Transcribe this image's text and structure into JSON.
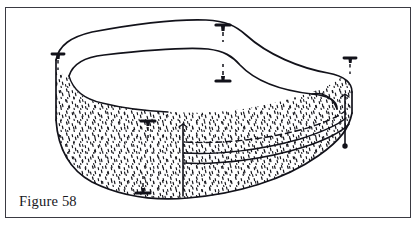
{
  "figure": {
    "caption": "Figure 58",
    "frame": {
      "border_color": "#3a3a42",
      "background_color": "#ffffff",
      "x": 5,
      "y": 7,
      "width": 406,
      "height": 211
    },
    "ink_color": "#12121a",
    "fabric_fill_color": "#ffffff",
    "stipple_color": "#16161c",
    "line_work": {
      "top_rim_outer": "M 56,59 C 60,44 72,36 92,32 C 140,23 178,19 206,20 C 226,21 236,26 246,35 C 268,55 300,68 328,73 C 344,76 352,82 352,92",
      "top_rim_inner": "M 69,73 C 74,62 86,57 104,55 C 148,50 184,47 208,49 C 224,51 232,56 240,65 C 256,82 286,90 312,93 C 328,95 336,99 336,108",
      "wall_bottom": "M 56,120 C 58,148 70,170 92,182 C 120,196 154,200 188,198 C 236,195 284,180 318,156 C 340,140 348,128 348,114",
      "wall_left_edge": "M 56,59 L 56,120",
      "wall_right_edge": "M 352,92 L 352,114",
      "stipple_top_left": "M 69,78 C 74,93 86,101 104,104",
      "corner_post_x": 183,
      "corner_post_top": 125,
      "corner_post_bottom": 196,
      "right_post_x": 345,
      "right_post_top": 96,
      "right_post_bottom": 146
    },
    "pins": [
      {
        "name": "pin-top-center",
        "head_x": 223,
        "head_y": 25,
        "stem_len": 15,
        "head_w": 13
      },
      {
        "name": "pin-top-left",
        "head_x": 58,
        "head_y": 54,
        "stem_len": 13,
        "head_w": 11
      },
      {
        "name": "pin-top-right",
        "head_x": 350,
        "head_y": 58,
        "stem_len": 13,
        "head_w": 11
      },
      {
        "name": "pin-mid-center",
        "head_x": 223,
        "head_y": 81,
        "stem_len": 14,
        "head_w": 13,
        "stem_up": true
      },
      {
        "name": "pin-front-upper",
        "head_x": 148,
        "head_y": 121,
        "stem_len": 14,
        "head_w": 12
      },
      {
        "name": "pin-front-lower",
        "head_x": 143,
        "head_y": 192,
        "stem_len": 14,
        "head_w": 12,
        "stem_up": true
      }
    ],
    "tuft_dot": {
      "name": "tuft-dot-right",
      "x": 345,
      "y": 146,
      "r": 2.6
    },
    "band": {
      "dashed_seam": "M 183,142 C 216,143 262,139 300,129 C 322,123 338,116 345,110",
      "solid_seam_upper": "M 183,152 C 216,153 262,149 300,139 C 322,133 338,126 345,120",
      "solid_seam_lower": "M 183,161 C 218,162 266,157 304,146 C 326,140 341,132 348,126"
    }
  }
}
